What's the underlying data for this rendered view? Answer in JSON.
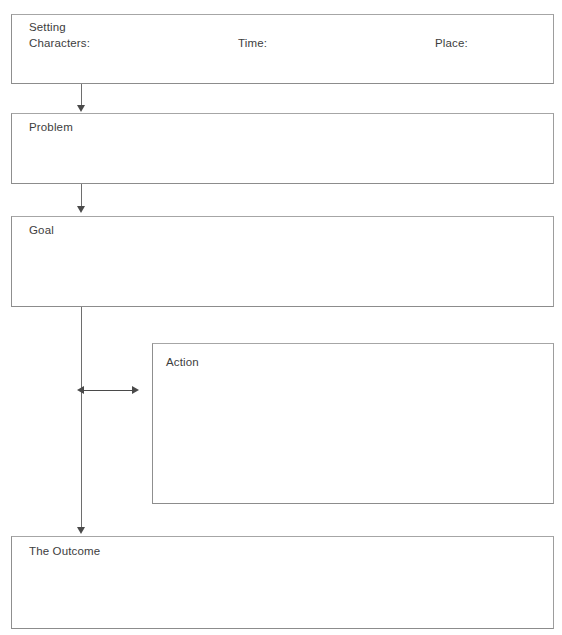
{
  "page": {
    "background_color": "#ffffff",
    "text_color": "#3d3d3d",
    "border_color": "#9a9a9a",
    "connector_color": "#4a4a4a",
    "width": 562,
    "height": 635,
    "clipped_header_text": "...."
  },
  "boxes": {
    "setting": {
      "title": "Setting",
      "characters_label": "Characters:",
      "time_label": "Time:",
      "place_label": "Place:"
    },
    "problem": {
      "title": "Problem"
    },
    "goal": {
      "title": "Goal"
    },
    "action": {
      "title": "Action"
    },
    "outcome": {
      "title": "The Outcome"
    }
  },
  "connectors": [
    {
      "name": "setting-to-problem",
      "type": "arrow-down"
    },
    {
      "name": "problem-to-goal",
      "type": "arrow-down"
    },
    {
      "name": "goal-to-outcome",
      "type": "arrow-down"
    },
    {
      "name": "goal-line-to-action",
      "type": "double-headed-arrow"
    }
  ]
}
